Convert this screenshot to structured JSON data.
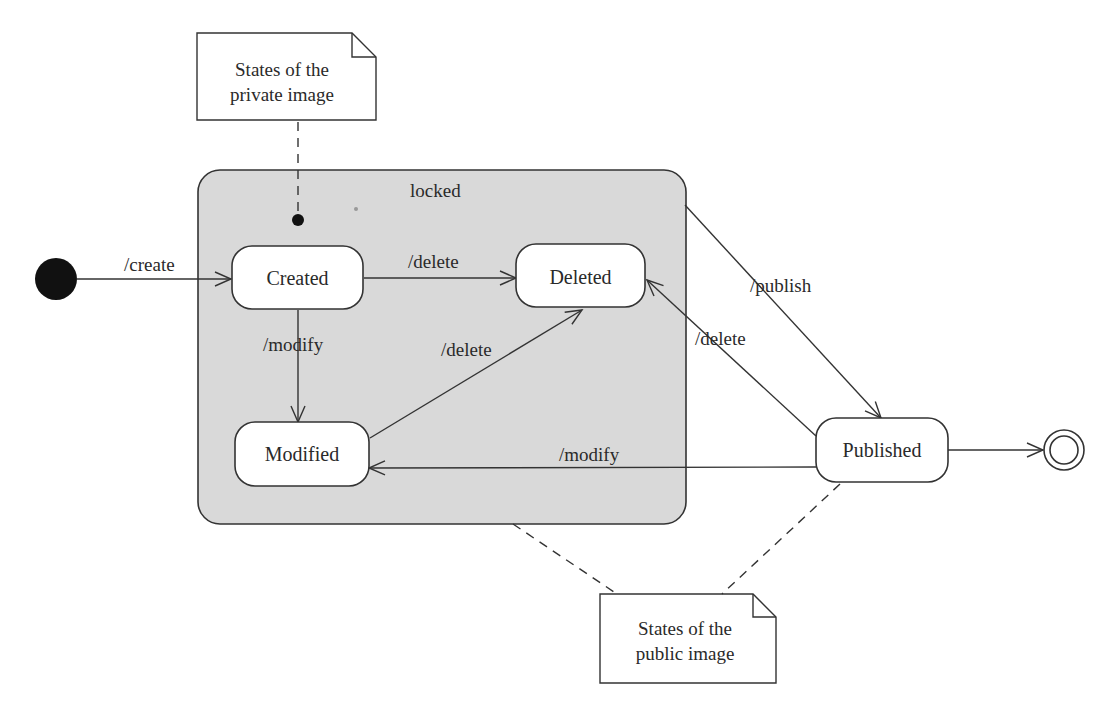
{
  "diagram": {
    "type": "UML state machine",
    "composite_state": {
      "name": "locked",
      "fill": "#d9d9d9"
    },
    "states": {
      "created": "Created",
      "deleted": "Deleted",
      "modified": "Modified",
      "published": "Published"
    },
    "transitions": {
      "initial_to_created": "/create",
      "created_to_deleted": "/delete",
      "created_to_modified": "/modify",
      "modified_to_deleted": "/delete",
      "locked_to_published": "/publish",
      "published_to_deleted": "/delete",
      "published_to_modified": "/modify"
    },
    "notes": {
      "private_line1": "States of the",
      "private_line2": "private image",
      "public_line1": "States of the",
      "public_line2": "public image"
    },
    "colors": {
      "stroke": "#333333",
      "composite_fill": "#d9d9d9",
      "state_fill": "#ffffff",
      "background": "#ffffff"
    }
  }
}
